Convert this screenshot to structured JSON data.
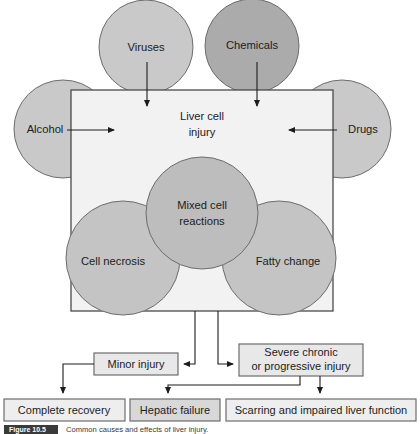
{
  "figure": {
    "caption_badge": "Figure 10.5",
    "caption_text": "Common causes and effects of liver injury."
  },
  "colors": {
    "circle_light": "#c9c9c9",
    "circle_mid": "#bdbdbd",
    "circle_dark": "#ababab",
    "box_fill": "#f2f2f2",
    "box_fill_alt": "#dcdcdc",
    "stroke": "#6d6d6d",
    "text": "#1c1c1c",
    "badge": "#3a3a3a"
  },
  "center_box": {
    "label_line1": "Liver cell",
    "label_line2": "injury"
  },
  "cause_circles": [
    {
      "id": "viruses",
      "label": "Viruses",
      "tone": "light"
    },
    {
      "id": "chemicals",
      "label": "Chemicals",
      "tone": "dark"
    },
    {
      "id": "alcohol",
      "label": "Alcohol",
      "tone": "light"
    },
    {
      "id": "drugs",
      "label": "Drugs",
      "tone": "light"
    }
  ],
  "effect_circles": [
    {
      "id": "mixed-cell-reactions",
      "label_line1": "Mixed cell",
      "label_line2": "reactions",
      "tone": "mid"
    },
    {
      "id": "cell-necrosis",
      "label_line1": "Cell necrosis",
      "label_line2": "",
      "tone": "mid"
    },
    {
      "id": "fatty-change",
      "label_line1": "Fatty change",
      "label_line2": "",
      "tone": "mid"
    }
  ],
  "outcome_boxes": {
    "minor_injury": "Minor injury",
    "severe_line1": "Severe chronic",
    "severe_line2": "or progressive injury"
  },
  "result_boxes": [
    {
      "id": "complete-recovery",
      "label": "Complete recovery"
    },
    {
      "id": "hepatic-failure",
      "label": "Hepatic failure"
    },
    {
      "id": "scarring",
      "label": "Scarring and impaired liver function"
    }
  ]
}
